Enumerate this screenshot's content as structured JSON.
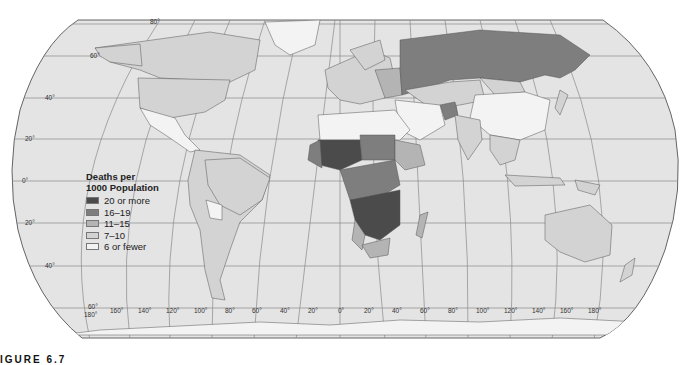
{
  "map": {
    "projection": "Robinson",
    "theme": "Death rates",
    "colors": {
      "ocean": "#e4e4e4",
      "grid": "#8a8a8a",
      "outline": "#555555",
      "class_20_or_more": "#4b4b4b",
      "class_16_19": "#7e7e7e",
      "class_11_15": "#b4b4b4",
      "class_7_10": "#d3d3d3",
      "class_6_or_fewer": "#f3f3f3"
    },
    "latitude_labels": [
      "80°",
      "60°",
      "40°",
      "20°",
      "0°",
      "20°",
      "40°",
      "60°"
    ],
    "longitude_labels": [
      "180°",
      "160°",
      "140°",
      "120°",
      "100°",
      "80°",
      "60°",
      "40°",
      "20°",
      "0°",
      "20°",
      "40°",
      "60°",
      "80°",
      "100°",
      "120°",
      "140°",
      "160°",
      "180°"
    ]
  },
  "legend": {
    "title_line1": "Deaths per",
    "title_line2": "1000 Population",
    "items": [
      {
        "label": "20 or more",
        "color": "#4b4b4b"
      },
      {
        "label": "16–19",
        "color": "#7e7e7e"
      },
      {
        "label": "11–15",
        "color": "#b4b4b4"
      },
      {
        "label": "7–10",
        "color": "#d3d3d3"
      },
      {
        "label": "6 or fewer",
        "color": "#f3f3f3"
      }
    ]
  },
  "caption": {
    "label": "IGURE 6.7"
  }
}
